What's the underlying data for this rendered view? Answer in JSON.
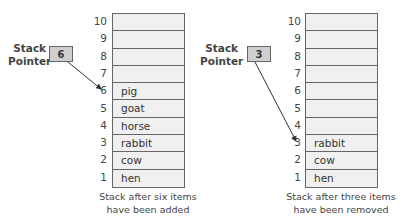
{
  "diagrams": [
    {
      "pointer_label_line1": "Stack",
      "pointer_label_line2": "Pointer",
      "pointer_value": "6",
      "indices": [
        "10",
        "9",
        "8",
        "7",
        "6",
        "5",
        "4",
        "3",
        "2",
        "1"
      ],
      "cells": [
        "",
        "",
        "",
        "",
        "pig",
        "goat",
        "horse",
        "rabbit",
        "cow",
        "hen"
      ],
      "caption_line1": "Stack after six items",
      "caption_line2": "have been added"
    },
    {
      "pointer_label_line1": "Stack",
      "pointer_label_line2": "Pointer",
      "pointer_value": "3",
      "indices": [
        "10",
        "9",
        "8",
        "7",
        "6",
        "5",
        "4",
        "3",
        "2",
        "1"
      ],
      "cells": [
        "",
        "",
        "",
        "",
        "",
        "",
        "",
        "rabbit",
        "cow",
        "hen"
      ],
      "caption_line1": "Stack after three items",
      "caption_line2": "have been removed"
    }
  ],
  "colors": {
    "cell_fill": "#f0f0f0",
    "pointer_fill": "#cfcfcf",
    "border": "#666666"
  }
}
